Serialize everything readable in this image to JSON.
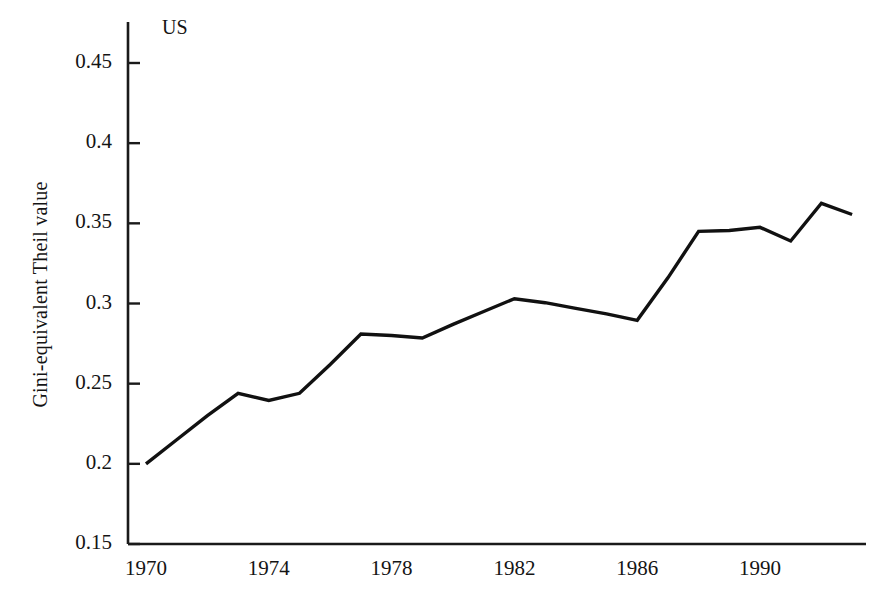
{
  "figure": {
    "annotation": "US",
    "y_axis_title": "Gini-equivalent Theil value"
  },
  "axes": {
    "y_ticks": [
      "0.45",
      "0.4",
      "0.35",
      "0.3",
      "0.25",
      "0.2",
      "0.15"
    ],
    "x_ticks": [
      "1970",
      "1974",
      "1978",
      "1982",
      "1986",
      "1990"
    ],
    "line_color": "#111111",
    "axis_color": "#1a1a1a"
  },
  "chart_data": {
    "type": "line",
    "title": "",
    "subtitle": "",
    "annotations": [
      "US"
    ],
    "xlabel": "",
    "ylabel": "Gini-equivalent Theil value",
    "xlim": [
      1970,
      1993
    ],
    "ylim": [
      0.15,
      0.47
    ],
    "xticks": [
      1970,
      1974,
      1978,
      1982,
      1986,
      1990
    ],
    "yticks": [
      0.15,
      0.2,
      0.25,
      0.3,
      0.35,
      0.4,
      0.45
    ],
    "grid": false,
    "legend": false,
    "x": [
      1970,
      1971,
      1972,
      1973,
      1974,
      1975,
      1976,
      1977,
      1978,
      1979,
      1980,
      1981,
      1982,
      1983,
      1984,
      1985,
      1986,
      1987,
      1988,
      1989,
      1990,
      1991,
      1992,
      1993
    ],
    "series": [
      {
        "name": "US",
        "values": [
          0.2,
          0.215,
          0.23,
          0.244,
          0.2395,
          0.244,
          0.262,
          0.281,
          0.28,
          0.2785,
          0.287,
          0.295,
          0.303,
          0.3005,
          0.297,
          0.2935,
          0.2895,
          0.316,
          0.345,
          0.3455,
          0.3475,
          0.339,
          0.3625,
          0.3555
        ]
      }
    ]
  }
}
